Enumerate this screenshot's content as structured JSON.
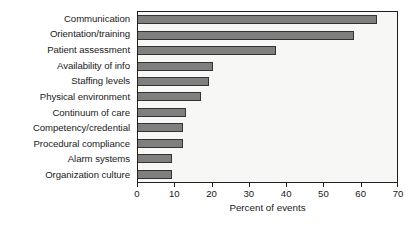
{
  "chart_data": {
    "type": "bar",
    "orientation": "horizontal",
    "title": "",
    "xlabel": "Percent of events",
    "ylabel": "",
    "xlim": [
      0,
      70
    ],
    "xticks": [
      0,
      10,
      20,
      30,
      40,
      50,
      60,
      70
    ],
    "xtick_labels": [
      "0",
      "10",
      "20",
      "30",
      "40",
      "50",
      "60",
      "70"
    ],
    "grid": false,
    "legend": null,
    "categories": [
      "Communication",
      "Orientation/training",
      "Patient assessment",
      "Availability of info",
      "Staffing levels",
      "Physical environment",
      "Continuum of care",
      "Competency/credential",
      "Procedural compliance",
      "Alarm systems",
      "Organization culture"
    ],
    "values": [
      64,
      58,
      37,
      20,
      19,
      17,
      13,
      12,
      12,
      9,
      9
    ],
    "series": [
      {
        "name": "Percent of events",
        "values": [
          64,
          58,
          37,
          20,
          19,
          17,
          13,
          12,
          12,
          9,
          9
        ]
      }
    ],
    "colors": {
      "bar_fill": "#7f7f7f",
      "bar_edge": "#333333",
      "plot_background": "#f7f7f5",
      "frame": "#231f20",
      "text": "#1a1a1a",
      "figure_background": "#ffffff"
    }
  }
}
